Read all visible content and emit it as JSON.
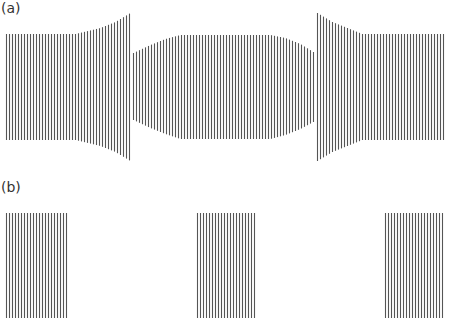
{
  "panels": {
    "a": {
      "label": "(a)",
      "description": "Grating with varying line length: two flared outer sections facing a bulging middle section",
      "line_color": "#555555",
      "line_spacing": 3,
      "segments": [
        {
          "name": "left",
          "x_start": 6,
          "x_end": 130,
          "profile": [
            [
              6,
              34,
              140
            ],
            [
              75,
              34,
              140
            ],
            [
              100,
              28,
              146
            ],
            [
              115,
              22,
              152
            ],
            [
              130,
              13,
              161
            ]
          ]
        },
        {
          "name": "middle",
          "x_start": 133,
          "x_end": 313,
          "profile": [
            [
              133,
              53,
              120
            ],
            [
              150,
              45,
              128
            ],
            [
              165,
              39,
              134
            ],
            [
              180,
              35,
              139
            ],
            [
              270,
              35,
              139
            ],
            [
              285,
              38,
              135
            ],
            [
              300,
              44,
              129
            ],
            [
              313,
              52,
              122
            ]
          ]
        },
        {
          "name": "right",
          "x_start": 317,
          "x_end": 444,
          "profile": [
            [
              317,
              13,
              161
            ],
            [
              332,
              22,
              152
            ],
            [
              347,
              28,
              146
            ],
            [
              362,
              34,
              140
            ],
            [
              444,
              34,
              140
            ]
          ]
        }
      ]
    },
    "b": {
      "label": "(b)",
      "description": "Three separated rectangular gratings of uniform line length",
      "line_color": "#555555",
      "line_spacing": 3,
      "blocks": [
        {
          "name": "left-block",
          "x_start": 6,
          "x_end": 67,
          "y_top": 213,
          "y_bottom": 318
        },
        {
          "name": "middle-block",
          "x_start": 197,
          "x_end": 256,
          "y_top": 213,
          "y_bottom": 318
        },
        {
          "name": "right-block",
          "x_start": 385,
          "x_end": 444,
          "y_top": 213,
          "y_bottom": 318
        }
      ]
    }
  }
}
